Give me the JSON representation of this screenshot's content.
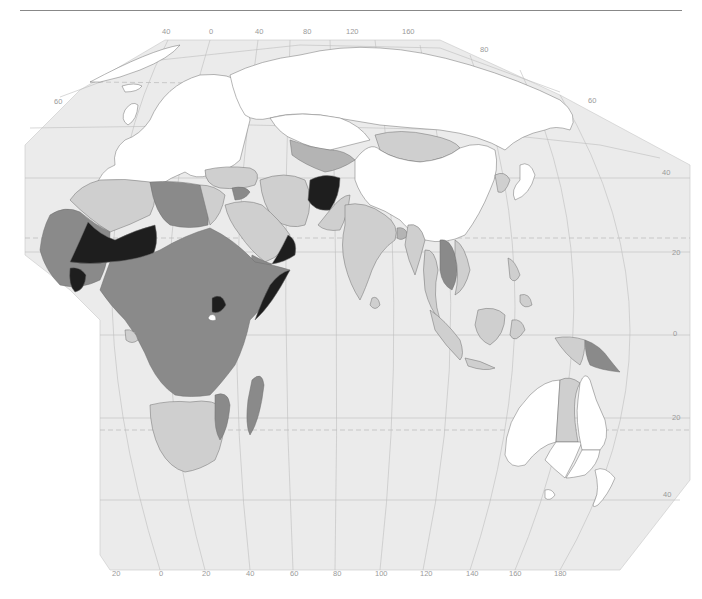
{
  "map": {
    "title": "",
    "projection": "Oblique world map centered on Eastern Hemisphere (Europe, Africa, Asia, Oceania)",
    "colors": {
      "ocean": "#ebebeb",
      "background": "#ffffff",
      "graticule": "#bdbdbd",
      "border": "#6e6e6e",
      "class_none": "#ffffff",
      "class_low": "#cfcfcf",
      "class_mid": "#b4b4b4",
      "class_high": "#8a8a8a",
      "class_very_high": "#1e1e1e"
    },
    "top_longitude_labels": [
      "40",
      "0",
      "40",
      "80",
      "120",
      "160"
    ],
    "bottom_longitude_labels": [
      "20",
      "0",
      "20",
      "40",
      "60",
      "80",
      "100",
      "120",
      "140",
      "160",
      "180"
    ],
    "left_latitude_labels": [
      "60"
    ],
    "right_latitude_labels": [
      "80",
      "60",
      "40",
      "20",
      "0",
      "20",
      "40"
    ],
    "regions": [
      {
        "name": "Europe",
        "class": "none"
      },
      {
        "name": "Russia",
        "class": "none"
      },
      {
        "name": "China",
        "class": "none"
      },
      {
        "name": "Japan",
        "class": "none"
      },
      {
        "name": "Australia (most states)",
        "class": "none"
      },
      {
        "name": "New Zealand",
        "class": "none"
      },
      {
        "name": "Mongolia",
        "class": "low"
      },
      {
        "name": "Northern Territory",
        "class": "low"
      },
      {
        "name": "India",
        "class": "low"
      },
      {
        "name": "Indonesia",
        "class": "low"
      },
      {
        "name": "Southern Africa",
        "class": "low"
      },
      {
        "name": "Algeria",
        "class": "low"
      },
      {
        "name": "Egypt",
        "class": "low"
      },
      {
        "name": "Saudi Arabia",
        "class": "low"
      },
      {
        "name": "Iran",
        "class": "low"
      },
      {
        "name": "Central Asia",
        "class": "mid"
      },
      {
        "name": "Papua New Guinea",
        "class": "high"
      },
      {
        "name": "Laos / Cambodia",
        "class": "high"
      },
      {
        "name": "Central & West Africa",
        "class": "high"
      },
      {
        "name": "Madagascar",
        "class": "high"
      },
      {
        "name": "Afghanistan",
        "class": "very_high"
      },
      {
        "name": "Niger / Mali",
        "class": "very_high"
      },
      {
        "name": "Somalia",
        "class": "very_high"
      },
      {
        "name": "Oman/Yemen coast",
        "class": "very_high"
      },
      {
        "name": "Uganda",
        "class": "very_high"
      }
    ]
  }
}
